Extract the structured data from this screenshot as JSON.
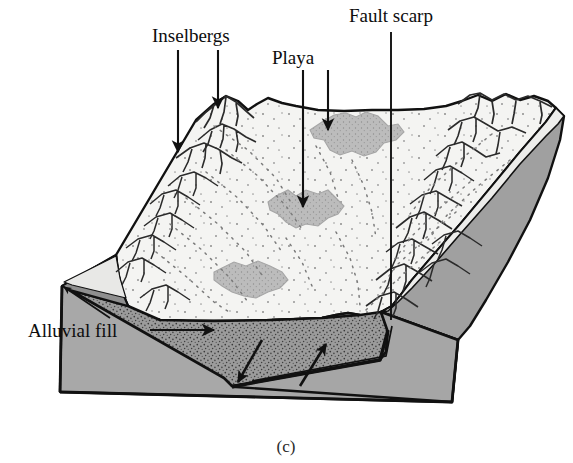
{
  "figure": {
    "caption": "(c)",
    "type": "block-diagram",
    "background_color": "#ffffff"
  },
  "labels": {
    "inselbergs": "Inselbergs",
    "playa": "Playa",
    "fault_scarp": "Fault scarp",
    "alluvial_fill": "Alluvial fill"
  },
  "colors": {
    "ink": "#111111",
    "surface": "#f4f4f2",
    "playa_fill": "#b9b9b9",
    "bedrock_gray": "#a8a8a8",
    "alluvium_gray": "#999999",
    "side_face": "#a0a0a0",
    "thin_cover": "#ededeb",
    "stipple": "#3a3a3a"
  },
  "features": {
    "inselberg_count_left": 9,
    "inselberg_count_right": 11,
    "playa_count": 3,
    "playa_labeled_count": 2,
    "fault_type": "normal fault",
    "fault_motion": "down-to-the-left, up-to-the-right"
  },
  "leaders": {
    "inselbergs": [
      {
        "x1": 178,
        "y1": 50,
        "x2": 178,
        "y2": 152
      },
      {
        "x1": 218,
        "y1": 50,
        "x2": 218,
        "y2": 108
      }
    ],
    "playa": [
      {
        "x1": 303,
        "y1": 70,
        "x2": 303,
        "y2": 207
      },
      {
        "x1": 328,
        "y1": 70,
        "x2": 328,
        "y2": 130
      }
    ],
    "fault_scarp": [
      {
        "x1": 391,
        "y1": 32,
        "x2": 391,
        "y2": 320
      }
    ],
    "alluvial_fill": [
      {
        "x1": 108,
        "y1": 318,
        "x2": 62,
        "y2": 286,
        "style": "thin-arrow"
      },
      {
        "x1": 152,
        "y1": 330,
        "x2": 212,
        "y2": 330,
        "style": "thick-arrow"
      }
    ]
  }
}
